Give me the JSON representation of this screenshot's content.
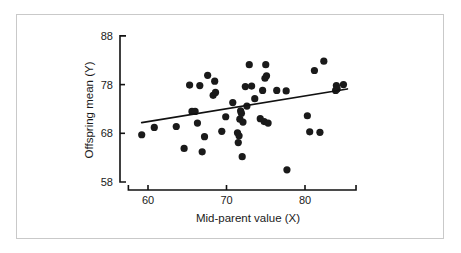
{
  "figure": {
    "background_color": "#ffffff",
    "frame_color": "#c9c9c9",
    "marker_color": "#1a1a1a",
    "line_color": "#111111"
  },
  "chart_data": {
    "type": "scatter",
    "title": "",
    "xlabel": "Mid-parent value (X)",
    "ylabel": "Offspring mean (Y)",
    "xlim": [
      57.5,
      86.5
    ],
    "ylim": [
      58,
      88
    ],
    "xticks": [
      60,
      70,
      80
    ],
    "xtick_labels": [
      "60",
      "70",
      "80"
    ],
    "yticks": [
      58,
      68,
      78,
      88
    ],
    "ytick_labels": [
      "58",
      "68",
      "78",
      "88"
    ],
    "grid": false,
    "legend": null,
    "marker": "filled-circle",
    "points": [
      {
        "x": 59.2,
        "y": 67.7
      },
      {
        "x": 60.8,
        "y": 69.2
      },
      {
        "x": 63.6,
        "y": 69.4
      },
      {
        "x": 64.6,
        "y": 64.9
      },
      {
        "x": 65.3,
        "y": 77.9
      },
      {
        "x": 65.6,
        "y": 72.5
      },
      {
        "x": 66.0,
        "y": 72.5
      },
      {
        "x": 66.3,
        "y": 70.1
      },
      {
        "x": 66.6,
        "y": 77.8
      },
      {
        "x": 66.9,
        "y": 64.2
      },
      {
        "x": 67.2,
        "y": 67.3
      },
      {
        "x": 67.6,
        "y": 79.9
      },
      {
        "x": 68.3,
        "y": 75.8
      },
      {
        "x": 68.5,
        "y": 78.7
      },
      {
        "x": 68.6,
        "y": 76.4
      },
      {
        "x": 69.4,
        "y": 68.4
      },
      {
        "x": 69.9,
        "y": 71.4
      },
      {
        "x": 70.8,
        "y": 74.3
      },
      {
        "x": 71.4,
        "y": 68.1
      },
      {
        "x": 71.5,
        "y": 66.1
      },
      {
        "x": 71.6,
        "y": 67.5
      },
      {
        "x": 71.7,
        "y": 70.9
      },
      {
        "x": 71.8,
        "y": 72.6
      },
      {
        "x": 71.9,
        "y": 72.1
      },
      {
        "x": 72.0,
        "y": 63.2
      },
      {
        "x": 72.1,
        "y": 70.3
      },
      {
        "x": 72.4,
        "y": 77.6
      },
      {
        "x": 72.6,
        "y": 73.6
      },
      {
        "x": 72.9,
        "y": 82.1
      },
      {
        "x": 73.2,
        "y": 77.7
      },
      {
        "x": 73.6,
        "y": 75.1
      },
      {
        "x": 74.3,
        "y": 71.0
      },
      {
        "x": 74.6,
        "y": 76.8
      },
      {
        "x": 74.8,
        "y": 70.4
      },
      {
        "x": 74.9,
        "y": 79.3
      },
      {
        "x": 75.0,
        "y": 82.1
      },
      {
        "x": 75.1,
        "y": 79.8
      },
      {
        "x": 75.3,
        "y": 70.1
      },
      {
        "x": 76.4,
        "y": 76.8
      },
      {
        "x": 77.6,
        "y": 76.7
      },
      {
        "x": 77.7,
        "y": 60.5
      },
      {
        "x": 80.3,
        "y": 71.6
      },
      {
        "x": 80.6,
        "y": 68.3
      },
      {
        "x": 81.2,
        "y": 80.9
      },
      {
        "x": 81.9,
        "y": 68.2
      },
      {
        "x": 82.4,
        "y": 82.8
      },
      {
        "x": 83.9,
        "y": 76.8
      },
      {
        "x": 84.0,
        "y": 77.8
      },
      {
        "x": 84.1,
        "y": 77.1
      },
      {
        "x": 84.9,
        "y": 78.0
      }
    ],
    "regression_line": {
      "x_start": 59.2,
      "y_start": 70.2,
      "x_end": 85.4,
      "y_end": 77.1
    }
  }
}
